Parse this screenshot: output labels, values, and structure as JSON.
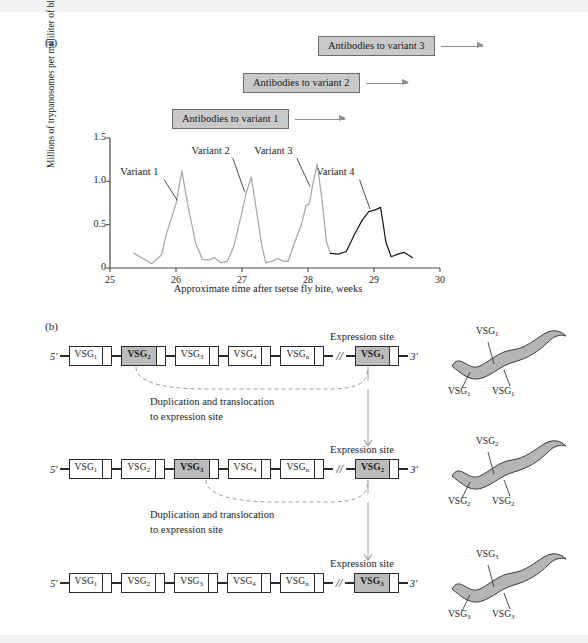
{
  "panels": {
    "a_letter": "(a)",
    "b_letter": "(b)"
  },
  "antibody_bars": [
    {
      "label": "Antibodies to variant 3",
      "left": 318,
      "top": 35,
      "arrow_width": 42
    },
    {
      "label": "Antibodies to variant 2",
      "left": 243,
      "top": 72,
      "arrow_width": 42
    },
    {
      "label": "Antibodies to variant 1",
      "left": 172,
      "top": 108,
      "arrow_width": 50
    }
  ],
  "chart_data": {
    "type": "line",
    "title": "",
    "xlabel": "Approximate time after tsetse fly bite, weeks",
    "ylabel": "Millions of trypanosomes per milliliter of blood",
    "xlim": [
      25,
      30
    ],
    "ylim": [
      0,
      1.5
    ],
    "xticks": [
      "25",
      "26",
      "27",
      "28",
      "29",
      "30"
    ],
    "yticks": [
      "0",
      "0.5",
      "1.0",
      "1.5"
    ],
    "grid": false,
    "legend": "inline-annotations",
    "annotations": [
      {
        "text": "Variant 1",
        "x": 25.55,
        "y": 1.08
      },
      {
        "text": "Variant 2",
        "x": 26.63,
        "y": 1.33
      },
      {
        "text": "Variant 3",
        "x": 27.58,
        "y": 1.33
      },
      {
        "text": "Variant 4",
        "x": 28.52,
        "y": 1.08
      }
    ],
    "series": [
      {
        "name": "Variant 1",
        "color": "#a8a8a8",
        "points": [
          [
            25.36,
            0.17
          ],
          [
            25.5,
            0.11
          ],
          [
            25.63,
            0.05
          ],
          [
            25.78,
            0.15
          ],
          [
            25.85,
            0.38
          ],
          [
            26.0,
            0.74
          ],
          [
            26.09,
            1.12
          ],
          [
            26.18,
            0.72
          ],
          [
            26.3,
            0.28
          ],
          [
            26.4,
            0.1
          ],
          [
            26.5,
            0.09
          ],
          [
            26.58,
            0.12
          ],
          [
            26.68,
            0.06
          ],
          [
            26.78,
            0.08
          ]
        ]
      },
      {
        "name": "Variant 2",
        "color": "#a8a8a8",
        "points": [
          [
            26.78,
            0.08
          ],
          [
            26.88,
            0.26
          ],
          [
            26.98,
            0.58
          ],
          [
            27.06,
            0.86
          ],
          [
            27.14,
            1.05
          ],
          [
            27.22,
            0.66
          ],
          [
            27.3,
            0.26
          ],
          [
            27.36,
            0.06
          ],
          [
            27.46,
            0.08
          ],
          [
            27.54,
            0.11
          ],
          [
            27.62,
            0.08
          ],
          [
            27.7,
            0.08
          ]
        ]
      },
      {
        "name": "Variant 3",
        "color": "#a8a8a8",
        "points": [
          [
            27.7,
            0.08
          ],
          [
            27.8,
            0.3
          ],
          [
            27.9,
            0.5
          ],
          [
            27.97,
            0.72
          ],
          [
            28.02,
            0.74
          ],
          [
            28.07,
            0.95
          ],
          [
            28.14,
            1.2
          ],
          [
            28.22,
            0.74
          ],
          [
            28.28,
            0.3
          ],
          [
            28.34,
            0.17
          ]
        ]
      },
      {
        "name": "Variant 4",
        "color": "#1a1a1a",
        "points": [
          [
            28.34,
            0.17
          ],
          [
            28.46,
            0.16
          ],
          [
            28.58,
            0.19
          ],
          [
            28.7,
            0.38
          ],
          [
            28.82,
            0.55
          ],
          [
            28.92,
            0.65
          ],
          [
            29.02,
            0.67
          ],
          [
            29.1,
            0.7
          ],
          [
            29.18,
            0.3
          ],
          [
            29.26,
            0.13
          ],
          [
            29.36,
            0.16
          ],
          [
            29.46,
            0.18
          ],
          [
            29.58,
            0.12
          ]
        ]
      }
    ]
  },
  "panel_b": {
    "five_prime": "5′",
    "three_prime": "3′",
    "break_symbol": "//",
    "expression_site_label": "Expression site",
    "process_line_1": "Duplication and translocation",
    "process_line_2": "to expression site",
    "rows": [
      {
        "genes": [
          {
            "label": "VSG",
            "sub": "1",
            "highlight": false
          },
          {
            "label": "VSG",
            "sub": "2",
            "highlight": true
          },
          {
            "label": "VSG",
            "sub": "3",
            "highlight": false
          },
          {
            "label": "VSG",
            "sub": "4",
            "highlight": false
          },
          {
            "label": "VSG",
            "sub": "n",
            "highlight": false
          }
        ],
        "expression_gene": {
          "label": "VSG",
          "sub": "1",
          "highlight": true
        },
        "source_index": 1
      },
      {
        "genes": [
          {
            "label": "VSG",
            "sub": "1",
            "highlight": false
          },
          {
            "label": "VSG",
            "sub": "2",
            "highlight": false
          },
          {
            "label": "VSG",
            "sub": "3",
            "highlight": true
          },
          {
            "label": "VSG",
            "sub": "4",
            "highlight": false
          },
          {
            "label": "VSG",
            "sub": "n",
            "highlight": false
          }
        ],
        "expression_gene": {
          "label": "VSG",
          "sub": "2",
          "highlight": true
        },
        "source_index": 2
      },
      {
        "genes": [
          {
            "label": "VSG",
            "sub": "1",
            "highlight": false
          },
          {
            "label": "VSG",
            "sub": "2",
            "highlight": false
          },
          {
            "label": "VSG",
            "sub": "3",
            "highlight": false
          },
          {
            "label": "VSG",
            "sub": "4",
            "highlight": false
          },
          {
            "label": "VSG",
            "sub": "n",
            "highlight": false
          }
        ],
        "expression_gene": {
          "label": "VSG",
          "sub": "3",
          "highlight": true
        },
        "source_index": -1
      }
    ],
    "trypanosomes": [
      {
        "coat": "VSG",
        "sub": "1",
        "top": 322
      },
      {
        "coat": "VSG",
        "sub": "2",
        "top": 432
      },
      {
        "coat": "VSG",
        "sub": "3",
        "top": 545
      }
    ]
  },
  "colors": {
    "antibody_box_fill": "#c9c9c9",
    "antibody_box_border": "#6b6b6b",
    "gene_highlight": "#bcbcbc",
    "curve_gray": "#a8a8a8",
    "curve_black": "#1a1a1a",
    "cell_fill": "#b5b5b5",
    "axis": "#4a4a4a"
  }
}
